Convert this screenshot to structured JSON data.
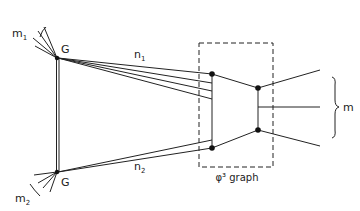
{
  "diagram": {
    "labels": {
      "m1": "m",
      "m1_sub": "1",
      "m2": "m",
      "m2_sub": "2",
      "g_top": "G",
      "g_bottom": "G",
      "n1": "n",
      "n1_sub": "1",
      "n2": "n",
      "n2_sub": "2",
      "m_out": "m",
      "box_label": "φ³ graph"
    },
    "colors": {
      "line": "#222222",
      "background": "#ffffff"
    }
  }
}
